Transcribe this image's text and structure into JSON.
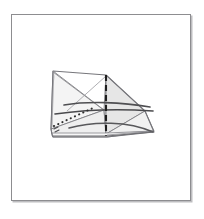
{
  "page": {
    "background_color": "#ffffff",
    "width": 204,
    "height": 219
  },
  "frame": {
    "name": "illustration-frame",
    "border_color": "#8d8d90",
    "shadow_color": "#bdbdc0",
    "fill_color": "#ffffff",
    "x": 11,
    "y": 14,
    "width": 180,
    "height": 187
  },
  "figure": {
    "title": "",
    "caption": "",
    "type": "line-art-diagram",
    "viewbox": "0 0 180 187",
    "colors": {
      "outline": "#7b7b80",
      "fill_light": "#f3f3f3",
      "fill_mid": "#e9e9e9",
      "fill_shade": "#dedede",
      "crease_dark": "#2b2b2b",
      "crease_mid": "#5a5a5a",
      "dotted": "#3a3a3a"
    },
    "shapes": [
      {
        "name": "left-wing-panel",
        "role": "filled-facet",
        "points": "41,56 40,62 39,114 92,95"
      },
      {
        "name": "left-lower-facet",
        "role": "filled-facet",
        "points": "39,114 92,95 94,119 40,119"
      },
      {
        "name": "center-left-facet",
        "role": "filled-facet",
        "points": "92,95 94,60 94,119"
      },
      {
        "name": "center-peak-facet",
        "role": "filled-facet",
        "points": "94,60 132,95 94,119"
      },
      {
        "name": "right-tail-facet",
        "role": "filled-facet",
        "points": "94,119 132,95 142,116"
      },
      {
        "name": "base-strip",
        "role": "filled-facet",
        "points": "40,119 94,119 142,116 95,122 41,122"
      }
    ],
    "lines": [
      {
        "name": "vertical-dashed-axis",
        "style": "dashed",
        "from": [
          94,
          60
        ],
        "to": [
          94,
          121
        ]
      },
      {
        "name": "upper-horizontal-crease",
        "style": "solid-curve",
        "from": [
          51,
          89
        ],
        "to": [
          139,
          92
        ]
      },
      {
        "name": "lower-horizontal-crease",
        "style": "solid-curve",
        "from": [
          42,
          98
        ],
        "to": [
          141,
          95
        ]
      },
      {
        "name": "dotted-diagonal-fold",
        "style": "dotted",
        "from": [
          42,
          110
        ],
        "to": [
          80,
          93
        ]
      },
      {
        "name": "sweeping-arc",
        "style": "solid-curve",
        "from": [
          58,
          113
        ],
        "to": [
          142,
          117
        ]
      }
    ],
    "vertices": [
      {
        "name": "left-peak",
        "x": 41,
        "y": 56
      },
      {
        "name": "center-apex",
        "x": 94,
        "y": 60
      },
      {
        "name": "right-tip",
        "x": 142,
        "y": 116
      },
      {
        "name": "bottom-left",
        "x": 40,
        "y": 120
      }
    ]
  }
}
